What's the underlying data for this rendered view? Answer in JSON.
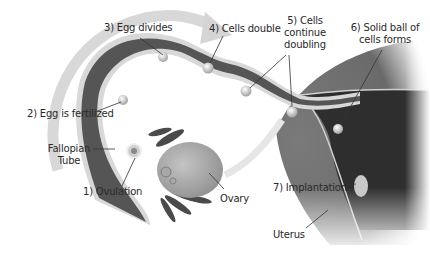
{
  "diagram": {
    "colors": {
      "tube": "#555555",
      "tube_edge": "#d8d8d8",
      "uterus": "#6e6e6e",
      "uterus_lining": "#2e2e2e",
      "ovary": "#b5b5b5",
      "arrow": "#d5d5d5",
      "text": "#2a2a2a",
      "leader": "#333333"
    },
    "labels": {
      "step1": "1) Ovulation",
      "step2": "2) Egg is fertilized",
      "step3": "3) Egg divides",
      "step4": "4) Cells double",
      "step5_line1": "5) Cells",
      "step5_line2": "continue",
      "step5_line3": "doubling",
      "step6_line1": "6) Solid ball of",
      "step6_line2": "cells forms",
      "step7": "7) Implantation",
      "fallopian_line1": "Fallopian",
      "fallopian_line2": "Tube",
      "ovary": "Ovary",
      "uterus": "Uterus"
    }
  }
}
